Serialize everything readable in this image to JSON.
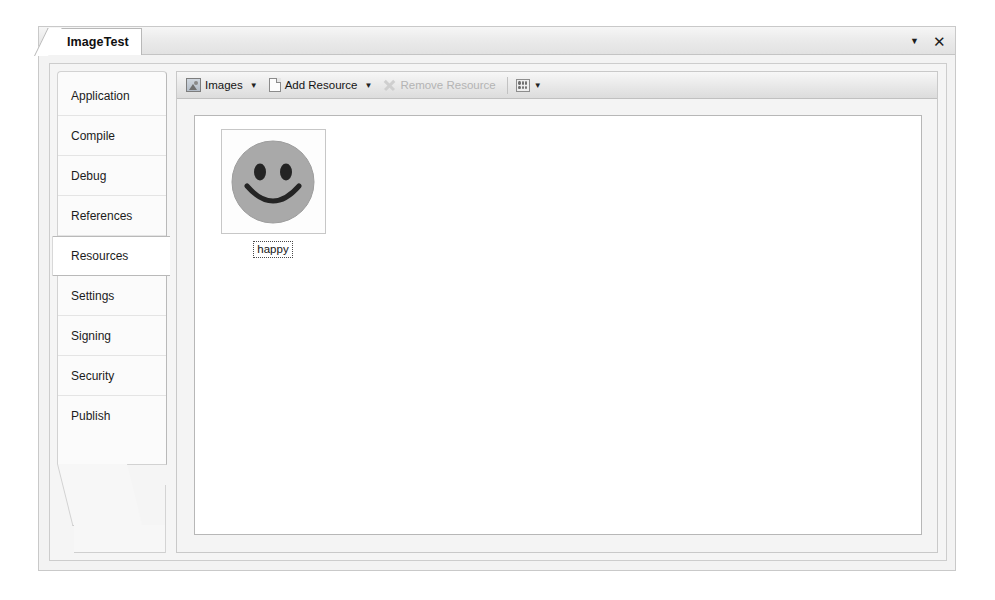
{
  "window": {
    "tab_title": "ImageTest",
    "tab_dropdown_icon": "chevron-down-icon",
    "tab_close_icon": "close-icon"
  },
  "sidebar": {
    "items": [
      {
        "label": "Application",
        "selected": false
      },
      {
        "label": "Compile",
        "selected": false
      },
      {
        "label": "Debug",
        "selected": false
      },
      {
        "label": "References",
        "selected": false
      },
      {
        "label": "Resources",
        "selected": true
      },
      {
        "label": "Settings",
        "selected": false
      },
      {
        "label": "Signing",
        "selected": false
      },
      {
        "label": "Security",
        "selected": false
      },
      {
        "label": "Publish",
        "selected": false
      }
    ]
  },
  "toolbar": {
    "category_label": "Images",
    "category_icon": "images-icon",
    "category_arrow": "▼",
    "add_label": "Add Resource",
    "add_icon": "page-icon",
    "add_arrow": "▼",
    "remove_label": "Remove Resource",
    "remove_icon": "x-icon",
    "remove_disabled": true,
    "view_icon": "grid-view-icon",
    "view_arrow": "▼"
  },
  "resources": {
    "items": [
      {
        "name": "happy",
        "type": "image",
        "image": "smiley-face",
        "selected": true
      }
    ]
  },
  "colors": {
    "window_bg": "#f3f3f3",
    "toolbar_bg": "#ececec",
    "list_bg": "#ffffff",
    "border": "#c9c9c9",
    "selected_tab_bg": "#ffffff",
    "disabled_text": "#b4b4b4",
    "smiley_face": "#a8a8a8",
    "smiley_features": "#2b2b2b"
  }
}
